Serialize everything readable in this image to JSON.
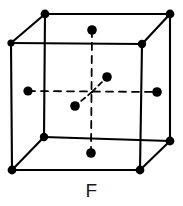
{
  "figure": {
    "caption": "F",
    "lattice_type": "face-centered-cubic",
    "colors": {
      "line": "#000000",
      "atom": "#000000",
      "background": "#ffffff"
    },
    "style": {
      "solid_edge_width": 2.1,
      "dashed_line_width": 1.8,
      "dash_pattern": "7 6",
      "corner_atom_radius": 4.0,
      "face_atom_radius": 4.6
    }
  },
  "geometry": {
    "front_face": {
      "top_left": [
        11,
        43
      ],
      "top_right": [
        142,
        44
      ],
      "bottom_right": [
        140,
        170
      ],
      "bottom_left": [
        12,
        170
      ]
    },
    "back_face": {
      "top_left": [
        45,
        14
      ],
      "top_right": [
        170,
        14
      ],
      "bottom_right": [
        170,
        141
      ],
      "bottom_left": [
        44,
        137
      ]
    },
    "center": [
      92,
      92
    ]
  },
  "atoms": {
    "corner": [
      {
        "name": "corner-front-top-left",
        "cx": 11,
        "cy": 43,
        "r": 3.6
      },
      {
        "name": "corner-front-top-right",
        "cx": 142,
        "cy": 44,
        "r": 4.2
      },
      {
        "name": "corner-front-bottom-right",
        "cx": 140,
        "cy": 170,
        "r": 4.4
      },
      {
        "name": "corner-front-bottom-left",
        "cx": 12,
        "cy": 170,
        "r": 4.4
      },
      {
        "name": "corner-back-top-left",
        "cx": 45,
        "cy": 14,
        "r": 4.4
      },
      {
        "name": "corner-back-top-right",
        "cx": 170,
        "cy": 14,
        "r": 4.4
      },
      {
        "name": "corner-back-bottom-right",
        "cx": 170,
        "cy": 141,
        "r": 4.4
      },
      {
        "name": "corner-back-bottom-left",
        "cx": 44,
        "cy": 137,
        "r": 4.2
      }
    ],
    "face_center": [
      {
        "name": "face-center-top",
        "cx": 92,
        "cy": 30,
        "r": 4.8
      },
      {
        "name": "face-center-bottom",
        "cx": 91,
        "cy": 153,
        "r": 4.8
      },
      {
        "name": "face-center-left",
        "cx": 28,
        "cy": 91,
        "r": 4.6
      },
      {
        "name": "face-center-right",
        "cx": 157,
        "cy": 92,
        "r": 4.8
      },
      {
        "name": "face-center-back",
        "cx": 107,
        "cy": 77,
        "r": 4.8
      },
      {
        "name": "face-center-front",
        "cx": 75,
        "cy": 106,
        "r": 4.8
      }
    ]
  },
  "dashed_lines": {
    "vertical_axis": {
      "x1": 92,
      "y1": 30,
      "x2": 91,
      "y2": 153
    },
    "horizontal_axis": {
      "x1": 28,
      "y1": 91,
      "x2": 157,
      "y2": 92
    },
    "diagonal_back": {
      "x1": 92,
      "y1": 92,
      "x2": 107,
      "y2": 77
    },
    "diagonal_front": {
      "x1": 92,
      "y1": 92,
      "x2": 75,
      "y2": 106
    }
  }
}
